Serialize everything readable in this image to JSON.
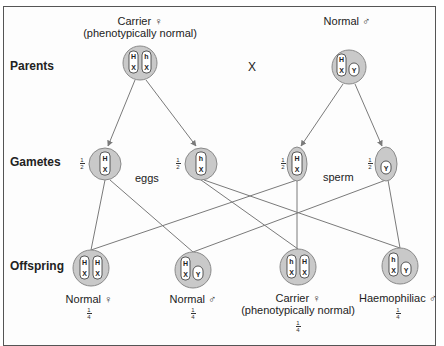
{
  "rows": {
    "parents": "Parents",
    "gametes": "Gametes",
    "offspring": "Offspring"
  },
  "parents": {
    "mother": {
      "label": "Carrier ♀",
      "sublabel": "(phenotypically normal)",
      "chromosomes": [
        "H/X",
        "h/X"
      ]
    },
    "cross": "X",
    "father": {
      "label": "Normal ♂",
      "chromosomes": [
        "H/X",
        "Y"
      ]
    }
  },
  "gametes": {
    "eggs_label": "eggs",
    "sperm_label": "sperm",
    "items": [
      {
        "type": "egg",
        "chromosome": "H/X",
        "fraction": "1/2"
      },
      {
        "type": "egg",
        "chromosome": "h/X",
        "fraction": "1/2"
      },
      {
        "type": "sperm",
        "chromosome": "H/X",
        "fraction": "1/2"
      },
      {
        "type": "sperm",
        "chromosome": "Y",
        "fraction": "1/2"
      }
    ]
  },
  "offspring": [
    {
      "label": "Normal ♀",
      "sublabel": "",
      "chromosomes": [
        "H/X",
        "H/X"
      ],
      "fraction": "1/4"
    },
    {
      "label": "Normal ♂",
      "sublabel": "",
      "chromosomes": [
        "H/X",
        "Y"
      ],
      "fraction": "1/4"
    },
    {
      "label": "Carrier ♀",
      "sublabel": "(phenotypically normal)",
      "chromosomes": [
        "h/X",
        "H/X"
      ],
      "fraction": "1/4"
    },
    {
      "label": "Haemophiliac ♂",
      "sublabel": "",
      "chromosomes": [
        "h/X",
        "Y"
      ],
      "fraction": "1/4"
    }
  ],
  "fractions": {
    "half_num": "1",
    "half_den": "2",
    "quarter_num": "1",
    "quarter_den": "4"
  },
  "colors": {
    "cell_fill": "#c9c9c9",
    "cell_stroke": "#8a8a8a",
    "line": "#7a7a7a",
    "chromosome_fill": "#ffffff"
  }
}
